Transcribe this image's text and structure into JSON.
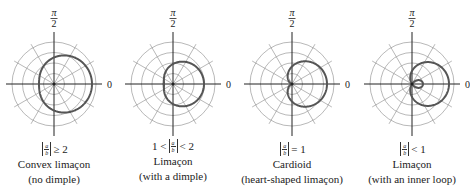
{
  "figure": {
    "colors": {
      "grid": "#9a9a9a",
      "axis": "#222222",
      "curve": "#555555",
      "text": "#222222"
    },
    "grid": {
      "rings": 4,
      "ring_spacing": 10.5,
      "radial_step_deg": 30,
      "axis_extent": 48
    },
    "axis_labels": {
      "top_num": "π",
      "top_den": "2",
      "right": "0"
    },
    "panels": [
      {
        "id": "convex",
        "center": [
          54,
          84
        ],
        "a": 26.5,
        "b": 11.5,
        "condition_prefix": "",
        "condition_op": "≥ 2",
        "name": "Convex limaçon",
        "note": "(no dimple)"
      },
      {
        "id": "dimple",
        "center": [
          173,
          84
        ],
        "a": 20,
        "b": 11,
        "condition_prefix": "1 <",
        "condition_op": "< 2",
        "name": "Limaçon",
        "note": "(with a dimple)"
      },
      {
        "id": "cardioid",
        "center": [
          292,
          84
        ],
        "a": 17.5,
        "b": 17.5,
        "condition_prefix": "",
        "condition_op": "= 1",
        "name": "Cardioid",
        "note": "(heart-shaped limaçon)"
      },
      {
        "id": "inner-loop",
        "center": [
          412,
          84
        ],
        "a": 13,
        "b": 24,
        "condition_prefix": "",
        "condition_op": "< 1",
        "name": "Limaçon",
        "note": "(with an inner loop)"
      }
    ],
    "fraction": {
      "num": "a",
      "den": "b"
    }
  }
}
